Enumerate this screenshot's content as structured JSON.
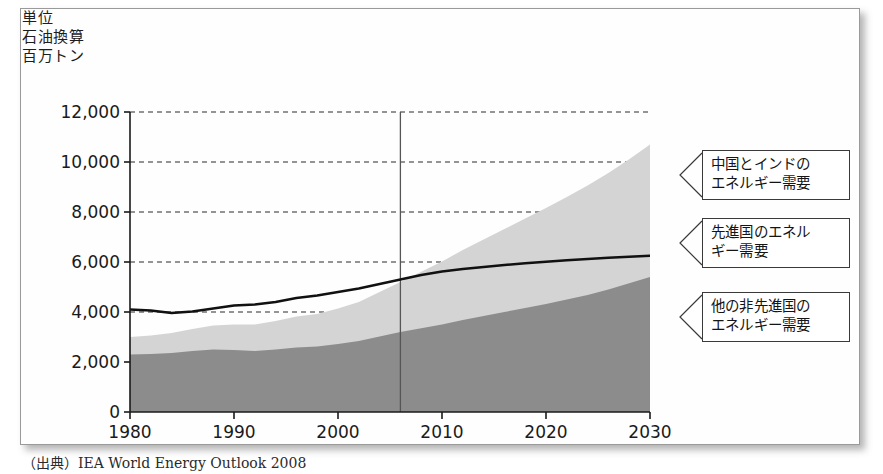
{
  "unit_note": "単位\n石油換算\n百万トン",
  "source": "（出典）IEA World Energy Outlook 2008",
  "callouts": [
    {
      "id": "china-india",
      "text": "中国とインドの\nエネルギー需要",
      "target_y": 8400
    },
    {
      "id": "developed",
      "text": "先進国のエネル\nギー需要",
      "target_y": 6240
    },
    {
      "id": "other-developing",
      "text": "他の非先進国の\nエネルギー需要",
      "target_y": 3100
    }
  ],
  "colors": {
    "band_other_developing": "#8c8c8c",
    "band_china_india": "#d4d4d4",
    "line_developed": "#111111",
    "frame": "#9a9a9a",
    "grid": "#2a2a2a",
    "axis": "#1a1a1a",
    "divider": "#555555",
    "background": "#fefefe"
  },
  "chart_data": {
    "type": "area",
    "title": "",
    "xlabel": "",
    "ylabel": "単位 石油換算 百万トン",
    "xlim": [
      1980,
      2030
    ],
    "ylim": [
      0,
      12000
    ],
    "ytick_values": [
      0,
      2000,
      4000,
      6000,
      8000,
      10000,
      12000
    ],
    "ytick_labels": [
      "0",
      "2,000",
      "4,000",
      "6,000",
      "8,000",
      "10,000",
      "12,000"
    ],
    "xtick_values": [
      1980,
      1990,
      2000,
      2010,
      2020,
      2030
    ],
    "xtick_labels": [
      "1980",
      "1990",
      "2000",
      "2010",
      "2020",
      "2030"
    ],
    "grid": "horizontal-dashed",
    "legend_position": "callout-boxes-right",
    "divider_x": 2006,
    "divider_note": "historical / projection boundary",
    "stacking": "cumulative",
    "x": [
      1980,
      1982,
      1984,
      1986,
      1988,
      1990,
      1992,
      1994,
      1996,
      1998,
      2000,
      2002,
      2004,
      2006,
      2008,
      2010,
      2012,
      2014,
      2016,
      2018,
      2020,
      2022,
      2024,
      2026,
      2028,
      2030
    ],
    "series": [
      {
        "name": "他の非先進国のエネルギー需要",
        "key": "other_developing",
        "stack_order": 1,
        "color": "#8c8c8c",
        "values": [
          2300,
          2320,
          2360,
          2440,
          2500,
          2480,
          2440,
          2500,
          2580,
          2620,
          2720,
          2840,
          3020,
          3200,
          3350,
          3500,
          3680,
          3840,
          4000,
          4160,
          4320,
          4500,
          4680,
          4900,
          5150,
          5400
        ]
      },
      {
        "name": "中国とインドのエネルギー需要",
        "key": "china_india",
        "stack_order": 2,
        "color": "#d4d4d4",
        "values": [
          700,
          740,
          800,
          880,
          960,
          1020,
          1060,
          1140,
          1240,
          1300,
          1420,
          1560,
          1780,
          2000,
          2260,
          2520,
          2800,
          3060,
          3320,
          3580,
          3840,
          4100,
          4380,
          4660,
          4960,
          5300
        ],
        "cumulative_top": [
          3000,
          3060,
          3160,
          3320,
          3460,
          3500,
          3500,
          3640,
          3820,
          3920,
          4140,
          4400,
          4800,
          5200,
          5610,
          6020,
          6480,
          6900,
          7320,
          7740,
          8160,
          8600,
          9060,
          9560,
          10110,
          10700
        ]
      },
      {
        "name": "先進国のエネルギー需要",
        "key": "developed",
        "type": "line",
        "color": "#111111",
        "values": [
          4100,
          4060,
          3960,
          4020,
          4140,
          4260,
          4300,
          4400,
          4560,
          4660,
          4800,
          4940,
          5120,
          5300,
          5480,
          5620,
          5720,
          5800,
          5880,
          5950,
          6010,
          6070,
          6120,
          6170,
          6210,
          6250
        ]
      }
    ]
  }
}
